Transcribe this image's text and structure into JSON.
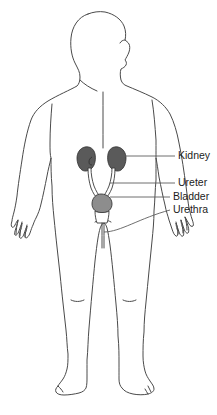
{
  "diagram": {
    "background_color": "#ffffff",
    "outline_color": "#4a4a4a",
    "figure": {
      "name": "human body outline",
      "pose": "standing, frontal, head in profile facing right, arms at sides"
    },
    "organs": [
      {
        "name": "left kidney",
        "color": "#5a5a5a",
        "shape": "bean"
      },
      {
        "name": "right kidney",
        "color": "#5a5a5a",
        "shape": "bean"
      },
      {
        "name": "bladder",
        "color": "#8d8d8d",
        "shape": "rounded"
      },
      {
        "name": "ureters",
        "color": "#3a3a3a",
        "shape": "tube"
      },
      {
        "name": "urethra",
        "color": "#3a3a3a",
        "shape": "tube"
      }
    ],
    "labels": [
      {
        "id": "kidney",
        "text": "Kidney",
        "x": 178,
        "y": 153
      },
      {
        "id": "ureter",
        "text": "Ureter",
        "x": 178,
        "y": 180
      },
      {
        "id": "bladder",
        "text": "Bladder",
        "x": 173,
        "y": 194
      },
      {
        "id": "urethra",
        "text": "Urethra",
        "x": 173,
        "y": 207
      }
    ]
  }
}
